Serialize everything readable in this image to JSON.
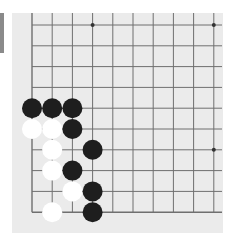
{
  "board": {
    "background": "#ebebeb",
    "line_color": "#6f6f6f",
    "columns_visible": 10,
    "rows_visible": 10,
    "edges": [
      "left",
      "bottom"
    ],
    "star_points": [
      {
        "col": 3,
        "row": 0
      },
      {
        "col": 9,
        "row": 0
      },
      {
        "col": 9,
        "row": 6
      }
    ],
    "stones": [
      {
        "color": "black",
        "col": 0,
        "row": 4
      },
      {
        "color": "black",
        "col": 1,
        "row": 4
      },
      {
        "color": "black",
        "col": 2,
        "row": 4
      },
      {
        "color": "white",
        "col": 0,
        "row": 5
      },
      {
        "color": "white",
        "col": 1,
        "row": 5
      },
      {
        "color": "black",
        "col": 2,
        "row": 5
      },
      {
        "color": "white",
        "col": 1,
        "row": 6
      },
      {
        "color": "black",
        "col": 3,
        "row": 6
      },
      {
        "color": "white",
        "col": 1,
        "row": 7
      },
      {
        "color": "black",
        "col": 2,
        "row": 7
      },
      {
        "color": "white",
        "col": 2,
        "row": 8
      },
      {
        "color": "black",
        "col": 3,
        "row": 8
      },
      {
        "color": "white",
        "col": 1,
        "row": 9
      },
      {
        "color": "black",
        "col": 3,
        "row": 9
      }
    ]
  },
  "colors": {
    "black_stone": "#1e1e1e",
    "white_stone": "#ffffff",
    "side_tab": "#8a8a8a"
  }
}
